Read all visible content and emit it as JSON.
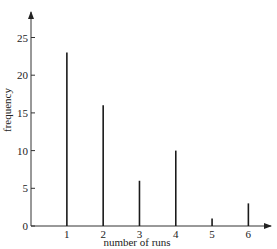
{
  "chart_data": {
    "type": "bar",
    "title": "",
    "xlabel": "number of runs",
    "ylabel": "frequency",
    "categories": [
      "1",
      "2",
      "3",
      "4",
      "5",
      "6"
    ],
    "x": [
      1,
      2,
      3,
      4,
      5,
      6
    ],
    "values": [
      23,
      16,
      6,
      10,
      1,
      3
    ],
    "ylim": [
      0,
      27
    ],
    "xlim": [
      0,
      6.6
    ],
    "yticks": [
      0,
      5,
      10,
      15,
      20,
      25
    ],
    "xticks": [
      1,
      2,
      3,
      4,
      5,
      6
    ],
    "grid": false,
    "legend": null,
    "style": "vertical line (stick) diagram",
    "colors": {
      "bars": "#1a1a1a",
      "axes": "#333333",
      "text": "#222222"
    }
  }
}
